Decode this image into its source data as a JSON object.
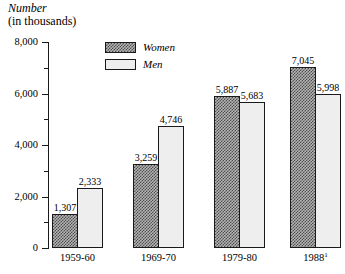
{
  "chart_data": {
    "type": "bar",
    "title": "Number",
    "subtitle": "(in thousands)",
    "ylabel": "Number (in thousands)",
    "xlabel": "",
    "ylim": [
      0,
      8000
    ],
    "y_ticks_major": [
      "0",
      "2,000",
      "4,000",
      "6,000",
      "8,000"
    ],
    "y_ticks_major_values": [
      0,
      2000,
      4000,
      6000,
      8000
    ],
    "y_ticks_minor_values": [
      1000,
      3000,
      5000,
      7000
    ],
    "grid": false,
    "legend_position": "top-center",
    "categories": [
      "1959-60",
      "1969-70",
      "1979-80",
      "1988"
    ],
    "category_labels": [
      "1959-60",
      "1969-70",
      "1979-80",
      "1988"
    ],
    "category_footnote_marks": [
      "",
      "",
      "",
      "1"
    ],
    "series": [
      {
        "name": "Women",
        "values": [
          1307,
          3259,
          5887,
          7045
        ],
        "value_labels": [
          "1,307",
          "3,259",
          "5,887",
          "7,045"
        ],
        "fill": "dark-stipple",
        "color": "#7a7a7a"
      },
      {
        "name": "Men",
        "values": [
          2333,
          4746,
          5683,
          5998
        ],
        "value_labels": [
          "2,333",
          "4,746",
          "5,683",
          "5,998"
        ],
        "fill": "light-solid",
        "color": "#eeeeee"
      }
    ]
  },
  "legend": {
    "items": [
      {
        "label": "Women"
      },
      {
        "label": "Men"
      }
    ]
  },
  "axis": {
    "title_line1": "Number",
    "title_line2": "(in thousands)"
  }
}
